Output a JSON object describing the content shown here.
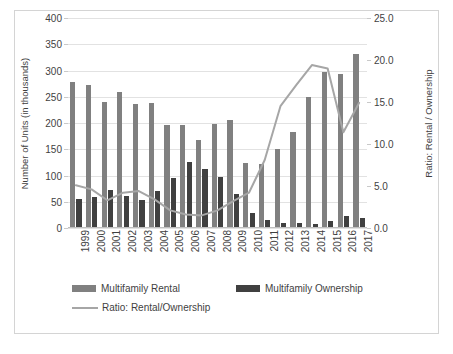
{
  "figure": {
    "background": "#ffffff",
    "border_color": "#d4d4d4"
  },
  "chart_data": {
    "type": "bar",
    "title": "",
    "subtitle": "",
    "xlabel": "",
    "ylabel": "Number of Units (in thousands)",
    "y2label": "Ratio: Rental / Ownership",
    "grid": true,
    "legend_position": "bottom-left",
    "ylim": [
      0,
      400
    ],
    "y2lim": [
      0.0,
      25.0
    ],
    "y_ticks": [
      0,
      50,
      100,
      150,
      200,
      250,
      300,
      350,
      400
    ],
    "y2_ticks": [
      "0.0",
      "5.0",
      "10.0",
      "15.0",
      "20.0",
      "25.0"
    ],
    "categories": [
      "1999",
      "2000",
      "2001",
      "2002",
      "2003",
      "2004",
      "2005",
      "2006",
      "2007",
      "2008",
      "2009",
      "2010",
      "2011",
      "2012",
      "2013",
      "2014",
      "2015",
      "2016",
      "2017"
    ],
    "series": [
      {
        "name": "Multifamily Rental",
        "type": "bar",
        "axis": "left",
        "color": "#808080",
        "values": [
          278,
          273,
          240,
          259,
          236,
          239,
          197,
          197,
          167,
          199,
          206,
          123,
          121,
          151,
          182,
          250,
          297,
          293,
          331
        ]
      },
      {
        "name": "Multifamily Ownership",
        "type": "bar",
        "axis": "left",
        "color": "#404040",
        "values": [
          55,
          59,
          73,
          61,
          54,
          70,
          95,
          126,
          113,
          97,
          64,
          29,
          15,
          10,
          9,
          8,
          14,
          22,
          19
        ]
      },
      {
        "name": "Ratio: Rental/Ownership",
        "type": "line",
        "axis": "right",
        "color": "#a6a6a6",
        "values": [
          5.1,
          4.6,
          3.3,
          4.2,
          4.4,
          3.4,
          2.1,
          1.6,
          1.5,
          2.1,
          3.2,
          4.2,
          8.1,
          15.1,
          20.2,
          31.3,
          21.2,
          13.3,
          17.4
        ],
        "plotted_values": [
          5.1,
          4.6,
          3.3,
          4.2,
          4.4,
          3.4,
          2.1,
          1.6,
          1.5,
          2.1,
          3.2,
          4.2,
          8.1,
          14.5,
          17.0,
          19.4,
          19.0,
          11.4,
          14.9
        ]
      }
    ]
  },
  "legend": {
    "items": [
      {
        "label": "Multifamily Rental",
        "marker": "bar-swatch",
        "color": "#808080"
      },
      {
        "label": "Multifamily Ownership",
        "marker": "bar-swatch",
        "color": "#404040"
      },
      {
        "label": "Ratio: Rental/Ownership",
        "marker": "line-swatch",
        "color": "#a6a6a6"
      }
    ]
  }
}
